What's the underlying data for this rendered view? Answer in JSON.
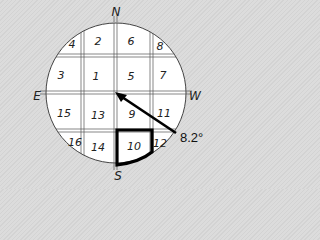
{
  "diagram": {
    "type": "compass-grid",
    "compass": {
      "north": "N",
      "south": "S",
      "east": "E",
      "west": "W"
    },
    "cells": [
      {
        "id": "4",
        "label": "4",
        "x": 72,
        "y": 42
      },
      {
        "id": "2",
        "label": "2",
        "x": 98,
        "y": 40
      },
      {
        "id": "6",
        "label": "6",
        "x": 131,
        "y": 40
      },
      {
        "id": "8",
        "label": "8",
        "x": 160,
        "y": 44
      },
      {
        "id": "3",
        "label": "3",
        "x": 61,
        "y": 75
      },
      {
        "id": "1",
        "label": "1",
        "x": 96,
        "y": 76
      },
      {
        "id": "5",
        "label": "5",
        "x": 131,
        "y": 76
      },
      {
        "id": "7",
        "label": "7",
        "x": 163,
        "y": 75
      },
      {
        "id": "15",
        "label": "15",
        "x": 64,
        "y": 113
      },
      {
        "id": "13",
        "label": "13",
        "x": 98,
        "y": 115
      },
      {
        "id": "9",
        "label": "9",
        "x": 132,
        "y": 114
      },
      {
        "id": "11",
        "label": "11",
        "x": 164,
        "y": 113
      },
      {
        "id": "16",
        "label": "16",
        "x": 74,
        "y": 142
      },
      {
        "id": "14",
        "label": "14",
        "x": 98,
        "y": 146
      },
      {
        "id": "10",
        "label": "10",
        "x": 134,
        "y": 146
      },
      {
        "id": "12",
        "label": "12",
        "x": 160,
        "y": 143
      }
    ],
    "highlighted_cell": "10",
    "arrow": {
      "label": "8.2°",
      "from": [
        176,
        133
      ],
      "to": [
        116,
        93
      ]
    }
  }
}
